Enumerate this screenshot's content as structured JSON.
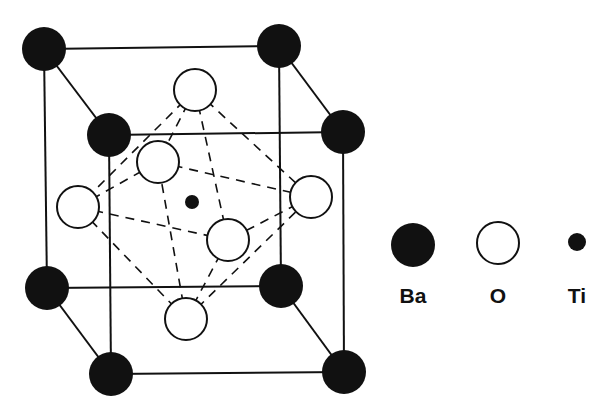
{
  "diagram": {
    "colors": {
      "ink": "#111111",
      "background": "#ffffff"
    },
    "atoms": {
      "Ba": [
        [
          44,
          49
        ],
        [
          279,
          46
        ],
        [
          109,
          135
        ],
        [
          343,
          132
        ],
        [
          47,
          288
        ],
        [
          281,
          286
        ],
        [
          111,
          374
        ],
        [
          344,
          372
        ]
      ],
      "O": [
        [
          195,
          90
        ],
        [
          78,
          207
        ],
        [
          158,
          162
        ],
        [
          311,
          197
        ],
        [
          228,
          240
        ],
        [
          186,
          319
        ]
      ],
      "Ti": [
        [
          192,
          202
        ]
      ]
    },
    "radii": {
      "Ba": 22,
      "O": 21,
      "Ti": 7
    },
    "cube_edges": [
      [
        0,
        1
      ],
      [
        2,
        3
      ],
      [
        4,
        5
      ],
      [
        6,
        7
      ],
      [
        0,
        4
      ],
      [
        1,
        5
      ],
      [
        2,
        6
      ],
      [
        3,
        7
      ],
      [
        0,
        2
      ],
      [
        1,
        3
      ],
      [
        4,
        6
      ],
      [
        5,
        7
      ]
    ],
    "octahedron_edges": [
      [
        0,
        1
      ],
      [
        0,
        2
      ],
      [
        0,
        3
      ],
      [
        0,
        4
      ],
      [
        5,
        1
      ],
      [
        5,
        2
      ],
      [
        5,
        3
      ],
      [
        5,
        4
      ],
      [
        1,
        2
      ],
      [
        2,
        3
      ],
      [
        3,
        4
      ],
      [
        4,
        1
      ]
    ]
  },
  "legend": {
    "items": [
      {
        "label": "Ba",
        "kind": "filled-large",
        "x": 413,
        "y": 245,
        "r": 22
      },
      {
        "label": "O",
        "kind": "hollow",
        "x": 498,
        "y": 243,
        "r": 21
      },
      {
        "label": "Ti",
        "kind": "filled-small",
        "x": 577,
        "y": 242,
        "r": 9
      }
    ]
  }
}
